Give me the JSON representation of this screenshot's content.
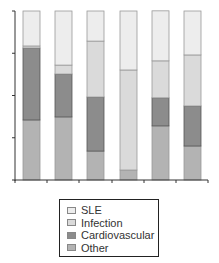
{
  "chart_data": {
    "type": "bar",
    "stacked": true,
    "title": "",
    "xlabel": "",
    "ylabel": "",
    "ylim": [
      0,
      100
    ],
    "y_ticks": [
      0,
      25,
      50,
      75,
      100
    ],
    "y_tick_labels_visible": false,
    "x_tick_labels_visible": false,
    "categories": [
      "1",
      "2",
      "3",
      "4",
      "5",
      "6"
    ],
    "series": [
      {
        "name": "Other",
        "color": "#b3b3b3",
        "values": [
          35.5,
          37.3,
          17.1,
          5.9,
          32.0,
          20.1
        ]
      },
      {
        "name": "Cardiovascular",
        "color": "#8c8c8c",
        "values": [
          42.6,
          25.4,
          32.0,
          0.0,
          16.6,
          23.7
        ]
      },
      {
        "name": "Infection",
        "color": "#dadada",
        "values": [
          1.2,
          5.3,
          33.1,
          59.2,
          21.9,
          30.2
        ]
      },
      {
        "name": "SLE",
        "color": "#ededed",
        "values": [
          20.7,
          32.0,
          17.8,
          34.9,
          29.6,
          26.0
        ]
      }
    ],
    "legend": {
      "position": "bottom",
      "entries": [
        "SLE",
        "Infection",
        "Cardiovascular",
        "Other"
      ]
    },
    "grid": false
  },
  "legend": {
    "items": [
      {
        "label": "SLE",
        "color": "#ededed"
      },
      {
        "label": "Infection",
        "color": "#dadada"
      },
      {
        "label": "Cardiovascular",
        "color": "#8c8c8c"
      },
      {
        "label": "Other",
        "color": "#b3b3b3"
      }
    ]
  }
}
